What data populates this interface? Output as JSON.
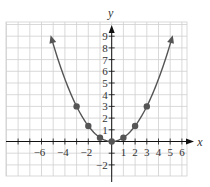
{
  "chart_data": {
    "type": "line",
    "title": "",
    "xlabel": "x",
    "ylabel": "y",
    "function": "y = x^2 / 3",
    "xlim": [
      -9,
      6.5
    ],
    "ylim": [
      -3,
      10.4
    ],
    "grid": true,
    "x_ticks": [
      -6,
      -5,
      -4,
      -3,
      -2,
      -1,
      1,
      2,
      3,
      4,
      5,
      6
    ],
    "x_tick_labels": [
      "-6",
      "-4",
      "-2",
      "1",
      "2",
      "3",
      "4",
      "5",
      "6"
    ],
    "x_tick_label_values": [
      -6,
      -4,
      -2,
      1,
      2,
      3,
      4,
      5,
      6
    ],
    "y_tick_labels": [
      "9",
      "8",
      "7",
      "6",
      "5",
      "4",
      "3",
      "2",
      "1",
      "-2"
    ],
    "y_tick_label_values": [
      9,
      8,
      7,
      6,
      5,
      4,
      3,
      2,
      1,
      -2
    ],
    "points": [
      {
        "x": -3,
        "y": 3
      },
      {
        "x": -2,
        "y": 1.33
      },
      {
        "x": -1,
        "y": 0.33
      },
      {
        "x": 0,
        "y": 0
      },
      {
        "x": 1,
        "y": 0.33
      },
      {
        "x": 2,
        "y": 1.33
      },
      {
        "x": 3,
        "y": 3
      }
    ],
    "curve_x_range": [
      -5.15,
      5.15
    ],
    "curve_arrows": true,
    "colors": {
      "curve": "#555555",
      "points": "#555555",
      "grid": "#cfcfcf",
      "axis": "#111111"
    }
  }
}
